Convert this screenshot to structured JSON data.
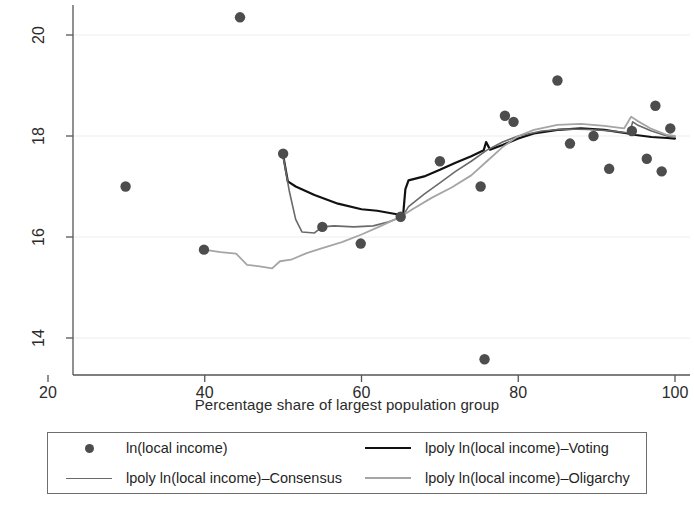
{
  "chart_data": {
    "type": "scatter",
    "title": "",
    "xlabel": "Percentage share of largest population group",
    "ylabel": "",
    "xlim": [
      20,
      101
    ],
    "ylim": [
      13.27,
      20.6
    ],
    "xticks": [
      20,
      40,
      60,
      80,
      100
    ],
    "yticks": [
      14,
      16,
      18,
      20
    ],
    "xtick_labels": [
      "20",
      "40",
      "60",
      "80",
      "100"
    ],
    "ytick_labels": [
      "14",
      "16",
      "18",
      "20"
    ],
    "grid": "horizontal-faint",
    "legend_position": "below-axes",
    "series": [
      {
        "name": "ln(local income)",
        "type": "scatter",
        "color": "#4d4d4d",
        "points": [
          {
            "x": 29.9,
            "y": 17.0
          },
          {
            "x": 39.9,
            "y": 15.75
          },
          {
            "x": 44.5,
            "y": 20.35
          },
          {
            "x": 50.0,
            "y": 17.65
          },
          {
            "x": 55.0,
            "y": 16.2
          },
          {
            "x": 59.9,
            "y": 15.87
          },
          {
            "x": 65.0,
            "y": 16.4
          },
          {
            "x": 70.0,
            "y": 17.5
          },
          {
            "x": 75.2,
            "y": 17.0
          },
          {
            "x": 75.7,
            "y": 13.58
          },
          {
            "x": 78.3,
            "y": 18.4
          },
          {
            "x": 79.4,
            "y": 18.28
          },
          {
            "x": 85.0,
            "y": 19.1
          },
          {
            "x": 86.6,
            "y": 17.85
          },
          {
            "x": 89.6,
            "y": 18.0
          },
          {
            "x": 91.6,
            "y": 17.35
          },
          {
            "x": 94.5,
            "y": 18.1
          },
          {
            "x": 96.4,
            "y": 17.55
          },
          {
            "x": 97.5,
            "y": 18.6
          },
          {
            "x": 98.3,
            "y": 17.3
          },
          {
            "x": 99.4,
            "y": 18.15
          }
        ]
      },
      {
        "name": "lpoly ln(local income)-Voting",
        "type": "line",
        "color": "#111111",
        "width": 2.2,
        "points": [
          {
            "x": 50.0,
            "y": 17.62
          },
          {
            "x": 50.6,
            "y": 17.1
          },
          {
            "x": 51.6,
            "y": 17.0
          },
          {
            "x": 54.0,
            "y": 16.83
          },
          {
            "x": 57.0,
            "y": 16.66
          },
          {
            "x": 60.0,
            "y": 16.55
          },
          {
            "x": 62.0,
            "y": 16.52
          },
          {
            "x": 64.5,
            "y": 16.45
          },
          {
            "x": 65.3,
            "y": 16.42
          },
          {
            "x": 65.6,
            "y": 16.95
          },
          {
            "x": 66.0,
            "y": 17.12
          },
          {
            "x": 68.0,
            "y": 17.2
          },
          {
            "x": 70.0,
            "y": 17.33
          },
          {
            "x": 72.0,
            "y": 17.47
          },
          {
            "x": 74.0,
            "y": 17.6
          },
          {
            "x": 75.6,
            "y": 17.72
          },
          {
            "x": 75.9,
            "y": 17.88
          },
          {
            "x": 76.4,
            "y": 17.73
          },
          {
            "x": 78.0,
            "y": 17.82
          },
          {
            "x": 80.0,
            "y": 17.95
          },
          {
            "x": 82.0,
            "y": 18.05
          },
          {
            "x": 85.0,
            "y": 18.12
          },
          {
            "x": 88.0,
            "y": 18.15
          },
          {
            "x": 91.0,
            "y": 18.12
          },
          {
            "x": 94.0,
            "y": 18.05
          },
          {
            "x": 95.0,
            "y": 18.02
          },
          {
            "x": 97.0,
            "y": 17.98
          },
          {
            "x": 99.0,
            "y": 17.96
          },
          {
            "x": 100.0,
            "y": 17.95
          }
        ]
      },
      {
        "name": "lpoly ln(local income)-Consensus",
        "type": "line",
        "color": "#6a6a6a",
        "width": 1.6,
        "points": [
          {
            "x": 50.0,
            "y": 17.6
          },
          {
            "x": 50.8,
            "y": 16.9
          },
          {
            "x": 51.6,
            "y": 16.35
          },
          {
            "x": 52.4,
            "y": 16.1
          },
          {
            "x": 54.0,
            "y": 16.08
          },
          {
            "x": 55.0,
            "y": 16.2
          },
          {
            "x": 56.5,
            "y": 16.22
          },
          {
            "x": 59.0,
            "y": 16.2
          },
          {
            "x": 61.5,
            "y": 16.22
          },
          {
            "x": 63.5,
            "y": 16.3
          },
          {
            "x": 65.2,
            "y": 16.4
          },
          {
            "x": 66.0,
            "y": 16.6
          },
          {
            "x": 68.0,
            "y": 16.85
          },
          {
            "x": 70.0,
            "y": 17.07
          },
          {
            "x": 72.0,
            "y": 17.3
          },
          {
            "x": 74.0,
            "y": 17.5
          },
          {
            "x": 76.0,
            "y": 17.72
          },
          {
            "x": 78.0,
            "y": 17.88
          },
          {
            "x": 80.0,
            "y": 18.0
          },
          {
            "x": 83.0,
            "y": 18.1
          },
          {
            "x": 86.0,
            "y": 18.14
          },
          {
            "x": 89.0,
            "y": 18.13
          },
          {
            "x": 92.0,
            "y": 18.1
          },
          {
            "x": 94.2,
            "y": 18.06
          },
          {
            "x": 94.6,
            "y": 18.28
          },
          {
            "x": 95.2,
            "y": 18.22
          },
          {
            "x": 97.0,
            "y": 18.1
          },
          {
            "x": 99.0,
            "y": 18.0
          },
          {
            "x": 100.0,
            "y": 17.98
          }
        ]
      },
      {
        "name": "lpoly ln(local income)-Oligarchy",
        "type": "line",
        "color": "#a5a5a5",
        "width": 1.8,
        "points": [
          {
            "x": 39.9,
            "y": 15.75
          },
          {
            "x": 42.0,
            "y": 15.7
          },
          {
            "x": 44.0,
            "y": 15.67
          },
          {
            "x": 45.4,
            "y": 15.45
          },
          {
            "x": 47.0,
            "y": 15.42
          },
          {
            "x": 48.6,
            "y": 15.38
          },
          {
            "x": 49.6,
            "y": 15.52
          },
          {
            "x": 51.0,
            "y": 15.55
          },
          {
            "x": 53.0,
            "y": 15.68
          },
          {
            "x": 55.0,
            "y": 15.78
          },
          {
            "x": 57.5,
            "y": 15.9
          },
          {
            "x": 60.0,
            "y": 16.05
          },
          {
            "x": 62.5,
            "y": 16.22
          },
          {
            "x": 65.0,
            "y": 16.4
          },
          {
            "x": 66.5,
            "y": 16.55
          },
          {
            "x": 69.0,
            "y": 16.78
          },
          {
            "x": 71.5,
            "y": 16.98
          },
          {
            "x": 74.0,
            "y": 17.22
          },
          {
            "x": 76.0,
            "y": 17.5
          },
          {
            "x": 78.0,
            "y": 17.78
          },
          {
            "x": 80.0,
            "y": 18.0
          },
          {
            "x": 82.0,
            "y": 18.12
          },
          {
            "x": 85.0,
            "y": 18.22
          },
          {
            "x": 88.0,
            "y": 18.24
          },
          {
            "x": 91.0,
            "y": 18.2
          },
          {
            "x": 93.5,
            "y": 18.15
          },
          {
            "x": 94.4,
            "y": 18.38
          },
          {
            "x": 95.2,
            "y": 18.3
          },
          {
            "x": 97.0,
            "y": 18.14
          },
          {
            "x": 99.0,
            "y": 18.02
          },
          {
            "x": 100.0,
            "y": 18.0
          }
        ]
      }
    ]
  },
  "legend": {
    "entries": [
      {
        "label": "ln(local income)",
        "marker": "dot",
        "color": "#4d4d4d"
      },
      {
        "label": "lpoly ln(local income)–Voting",
        "marker": "line",
        "color": "#111111"
      },
      {
        "label": "lpoly ln(local income)–Consensus",
        "marker": "line",
        "color": "#6a6a6a"
      },
      {
        "label": "lpoly ln(local income)–Oligarchy",
        "marker": "line",
        "color": "#a5a5a5"
      }
    ]
  },
  "axis": {
    "x_title": "Percentage share of largest population group",
    "x_tick_labels": [
      "20",
      "40",
      "60",
      "80",
      "100"
    ],
    "y_tick_labels": [
      "14",
      "16",
      "18",
      "20"
    ]
  }
}
